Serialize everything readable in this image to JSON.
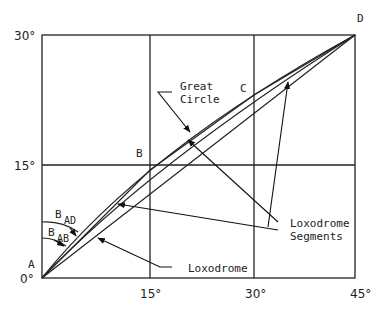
{
  "figure": {
    "axes": {
      "x_ticks": [
        "0°",
        "15°",
        "30°",
        "45°"
      ],
      "y_ticks": [
        "0°",
        "15°",
        "30°"
      ]
    },
    "points": {
      "A": "A",
      "B": "B",
      "C": "C",
      "D": "D"
    },
    "angles": {
      "b_ad_main": "B",
      "b_ad_sub": "AD",
      "b_ab_main": "B",
      "b_ab_sub": "AB"
    },
    "callouts": {
      "great_circle_line1": "Great",
      "great_circle_line2": "Circle",
      "loxodrome_segments_line1": "Loxodrome",
      "loxodrome_segments_line2": "Segments",
      "loxodrome": "Loxodrome"
    }
  }
}
